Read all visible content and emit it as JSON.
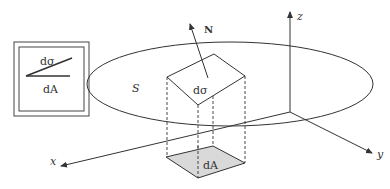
{
  "diagram": {
    "inset": {
      "top_label": "dσ",
      "bottom_label": "dA"
    },
    "surface_label": "S",
    "normal_label": "N",
    "patch_label": "dσ",
    "projection_label": "dA",
    "axes": {
      "x": "x",
      "y": "y",
      "z": "z"
    },
    "colors": {
      "stroke": "#333333",
      "projection_fill": "#d9d9d9",
      "background": "#ffffff"
    }
  }
}
